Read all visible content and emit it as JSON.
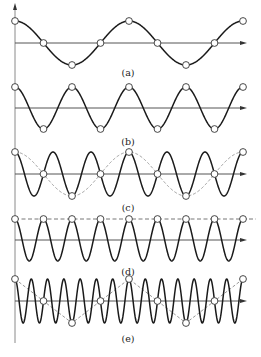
{
  "figure": {
    "sample_count": 9
  },
  "chart_data": {
    "type": "line",
    "title": "",
    "xlabel": "",
    "ylabel": "",
    "sample_index": [
      0,
      1,
      2,
      3,
      4,
      5,
      6,
      7,
      8
    ],
    "panels": [
      {
        "label": "(a)",
        "signal_cycles_per_sample": 0.25,
        "alias_cycles_per_sample": null,
        "alias_style": null,
        "sample_values": [
          1,
          0,
          -1,
          0,
          1,
          0,
          -1,
          0,
          1
        ]
      },
      {
        "label": "(b)",
        "signal_cycles_per_sample": 0.5,
        "alias_cycles_per_sample": null,
        "alias_style": null,
        "sample_values": [
          1,
          -1,
          1,
          -1,
          1,
          -1,
          1,
          -1,
          1
        ]
      },
      {
        "label": "(c)",
        "signal_cycles_per_sample": 0.75,
        "alias_cycles_per_sample": 0.25,
        "alias_style": "dashed-curve",
        "sample_values": [
          1,
          0,
          -1,
          0,
          1,
          0,
          -1,
          0,
          1
        ]
      },
      {
        "label": "(d)",
        "signal_cycles_per_sample": 1.0,
        "alias_cycles_per_sample": 0,
        "alias_style": "dashed-line",
        "sample_values": [
          1,
          1,
          1,
          1,
          1,
          1,
          1,
          1,
          1
        ]
      },
      {
        "label": "(e)",
        "signal_cycles_per_sample": 1.75,
        "alias_cycles_per_sample": 0.25,
        "alias_style": "dashed-polyline",
        "sample_values": [
          1,
          0,
          -1,
          0,
          1,
          0,
          -1,
          0,
          1
        ]
      }
    ]
  }
}
